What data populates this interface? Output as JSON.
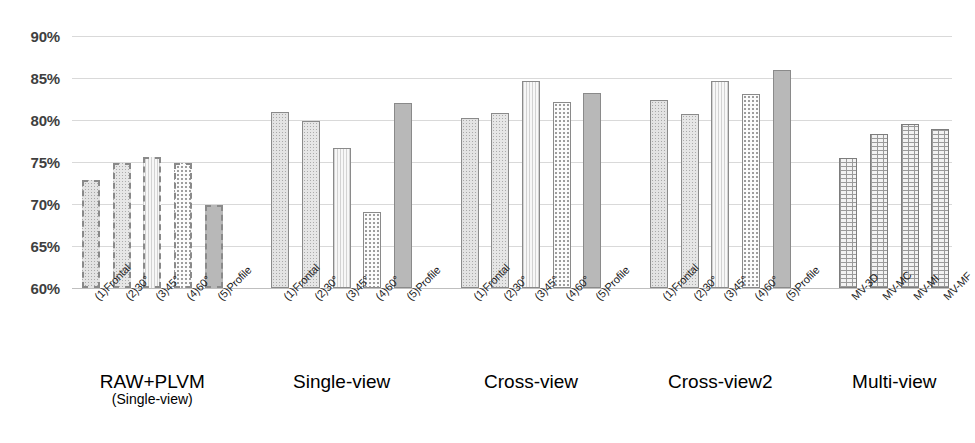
{
  "chart_data": {
    "type": "bar",
    "title": "",
    "xlabel": "",
    "ylabel": "",
    "ylim": [
      60,
      90
    ],
    "ytick_labels": [
      "90%",
      "85%",
      "80%",
      "75%",
      "70%",
      "65%",
      "60%"
    ],
    "ytick_values": [
      90,
      85,
      80,
      75,
      70,
      65,
      60
    ],
    "grid": true,
    "legend": "none",
    "groups": [
      {
        "name": "RAW+PLVM",
        "sub": "(Single-view)",
        "categories": [
          "(1)Frontal",
          "(2)30°",
          "(3)45°",
          "(4)60°",
          "(5)Profile"
        ],
        "values": [
          72.9,
          74.9,
          75.6,
          74.9,
          69.9
        ],
        "styles": [
          "fill-dot-med dashed-border",
          "fill-dot-med2 dashed-border",
          "fill-vline dashed-border",
          "fill-dot-sparse dashed-border",
          "fill-solid dashed-border"
        ]
      },
      {
        "name": "Single-view",
        "sub": "",
        "categories": [
          "(1)Frontal",
          "(2)30°",
          "(3)45°",
          "(4)60°",
          "(5)Profile"
        ],
        "values": [
          80.9,
          79.9,
          76.7,
          69.1,
          82.0
        ],
        "styles": [
          "fill-dot-med",
          "fill-dot-med2",
          "fill-vline",
          "fill-dot-sparse",
          "fill-solid"
        ]
      },
      {
        "name": "Cross-view",
        "sub": "",
        "categories": [
          "(1)Frontal",
          "(2)30°",
          "(3)45°",
          "(4)60°",
          "(5)Profile"
        ],
        "values": [
          80.2,
          80.8,
          84.7,
          82.1,
          83.2
        ],
        "styles": [
          "fill-dot-med",
          "fill-dot-med2",
          "fill-vline",
          "fill-dot-sparse",
          "fill-solid"
        ]
      },
      {
        "name": "Cross-view2",
        "sub": "",
        "categories": [
          "(1)Frontal",
          "(2)30°",
          "(3)45°",
          "(4)60°",
          "(5)Profile"
        ],
        "values": [
          82.4,
          80.7,
          84.6,
          83.1,
          85.9
        ],
        "styles": [
          "fill-dot-med",
          "fill-dot-med2",
          "fill-vline",
          "fill-dot-sparse",
          "fill-solid"
        ]
      },
      {
        "name": "Multi-view",
        "sub": "",
        "categories": [
          "MV-3D",
          "MV-MC",
          "MV-MI",
          "MV-MF"
        ],
        "values": [
          75.5,
          78.3,
          79.5,
          78.9
        ],
        "styles": [
          "fill-brick",
          "fill-brick",
          "fill-brick",
          "fill-brick"
        ]
      }
    ],
    "colors": {
      "gridline": "#d9d9d9",
      "axis_text": "#3f3f3f",
      "label_text": "#1a1a1a",
      "bar_outline": "#8a8a8a",
      "bar_solid": "#b8b8b8"
    }
  }
}
